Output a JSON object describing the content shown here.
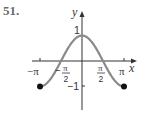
{
  "problem_number": "51.",
  "axes": {
    "x_label": "x",
    "y_label": "y",
    "x_ticks": [
      {
        "label": "−π",
        "value": -3.14159
      },
      {
        "label_num": "π",
        "label_den": "2",
        "sign": "−",
        "value": -1.5708
      },
      {
        "label_num": "π",
        "label_den": "2",
        "sign": "",
        "value": 1.5708
      },
      {
        "label": "π",
        "value": 3.14159
      }
    ],
    "y_ticks": [
      {
        "label": "1",
        "value": 1
      },
      {
        "label": "−1",
        "value": -1
      }
    ]
  },
  "colors": {
    "curve": "#8a8a8a",
    "axes": "#333333",
    "text": "#333333",
    "endpoint": "#111111"
  },
  "chart_data": {
    "type": "line",
    "title": "",
    "function": "y = cos(x)",
    "xlabel": "x",
    "ylabel": "y",
    "xlim": [
      -3.14159,
      3.14159
    ],
    "ylim": [
      -1,
      1
    ],
    "grid": false,
    "legend": null,
    "x": [
      -3.14159,
      -2.35619,
      -1.5708,
      -0.7854,
      0,
      0.7854,
      1.5708,
      2.35619,
      3.14159
    ],
    "series": [
      {
        "name": "cos(x)",
        "values": [
          -1,
          -0.7071,
          0,
          0.7071,
          1,
          0.7071,
          0,
          -0.7071,
          -1
        ]
      }
    ],
    "x_tick_labels": [
      "−π",
      "−π/2",
      "π/2",
      "π"
    ],
    "y_tick_labels": [
      "1",
      "−1"
    ],
    "annotations": [
      {
        "type": "closed-endpoint",
        "x": -3.14159,
        "y": -1
      },
      {
        "type": "closed-endpoint",
        "x": 3.14159,
        "y": -1
      }
    ]
  }
}
